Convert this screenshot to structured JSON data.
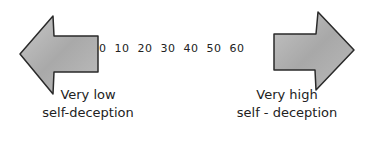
{
  "diagram": {
    "scale": {
      "ticks": [
        "0",
        "10",
        "20",
        "30",
        "40",
        "50",
        "60"
      ]
    },
    "left_arrow": {
      "direction": "left",
      "label_line1": "Very low",
      "label_line2": "self-deception"
    },
    "right_arrow": {
      "direction": "right",
      "label_line1": "Very high",
      "label_line2": "self - deception"
    },
    "colors": {
      "arrow_fill": "#b8b8b8",
      "arrow_stroke": "#2a2a2a",
      "text": "#222222"
    }
  }
}
